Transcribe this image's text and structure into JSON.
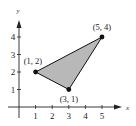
{
  "diagram": {
    "type": "coordinate-plane-triangle",
    "axes": {
      "x_label": "x",
      "y_label": "y",
      "x_ticks": [
        "1",
        "2",
        "3",
        "4",
        "5"
      ],
      "y_ticks": [
        "1",
        "2",
        "3",
        "4"
      ]
    },
    "vertices": [
      {
        "label": "(1, 2)",
        "x": 1,
        "y": 2
      },
      {
        "label": "(3, 1)",
        "x": 3,
        "y": 1
      },
      {
        "label": "(5, 4)",
        "x": 5,
        "y": 4
      }
    ],
    "colors": {
      "fill": "#b8b8b8",
      "stroke": "#111111",
      "axis": "#222222"
    }
  }
}
